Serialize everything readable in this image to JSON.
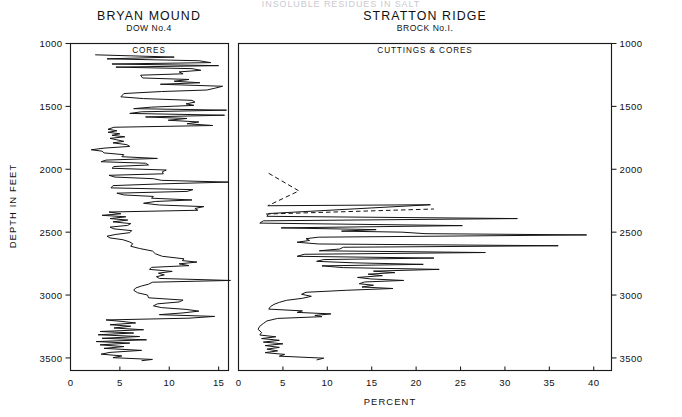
{
  "figure": {
    "top_title": "INSOLUBLE RESIDUES IN SALT",
    "x_axis_label": "PERCENT",
    "y_axis_label": "DEPTH IN FEET",
    "y_ticks": [
      "1000",
      "1500",
      "2000",
      "2500",
      "3000",
      "3500"
    ],
    "y_tick_values": [
      1000,
      1500,
      2000,
      2500,
      3000,
      3500
    ]
  },
  "panels": {
    "left": {
      "title": "BRYAN MOUND",
      "subtitle": "DOW No.4",
      "material": "CORES",
      "x_ticks": [
        "0",
        "5",
        "10",
        "15"
      ],
      "x_tick_values": [
        0,
        5,
        10,
        15
      ]
    },
    "right": {
      "title": "STRATTON RIDGE",
      "subtitle": "BROCK No.I.",
      "material": "CUTTINGS & CORES",
      "x_ticks": [
        "0",
        "5",
        "10",
        "15",
        "20",
        "25",
        "30",
        "35",
        "40"
      ],
      "x_tick_values": [
        0,
        5,
        10,
        15,
        20,
        25,
        30,
        35,
        40
      ]
    }
  },
  "colors": {
    "ink": "#141414",
    "background": "#ffffff",
    "faint_title": "#c9c9cf"
  },
  "chart_data": {
    "type": "line",
    "title": "INSOLUBLE RESIDUES IN SALT",
    "xlabel": "PERCENT",
    "ylabel": "DEPTH IN FEET",
    "orientation": "vertical-depth",
    "y_inverted": true,
    "ylim": [
      1000,
      3600
    ],
    "grid": false,
    "legend": "none",
    "series": [
      {
        "name": "BRYAN MOUND DOW No.4 — CORES",
        "panel": "left",
        "xlim": [
          0,
          16
        ],
        "style": "solid",
        "points": [
          [
            2.5,
            1090
          ],
          [
            10.5,
            1108
          ],
          [
            3.7,
            1122
          ],
          [
            13.0,
            1137
          ],
          [
            14.2,
            1152
          ],
          [
            4.2,
            1163
          ],
          [
            15.0,
            1176
          ],
          [
            4.6,
            1188
          ],
          [
            12.3,
            1200
          ],
          [
            13.2,
            1213
          ],
          [
            11.0,
            1226
          ],
          [
            11.4,
            1241
          ],
          [
            7.1,
            1252
          ],
          [
            7.3,
            1274
          ],
          [
            12.0,
            1286
          ],
          [
            10.5,
            1300
          ],
          [
            13.1,
            1312
          ],
          [
            9.1,
            1324
          ],
          [
            15.4,
            1340
          ],
          [
            14.6,
            1356
          ],
          [
            13.8,
            1370
          ],
          [
            9.2,
            1382
          ],
          [
            5.4,
            1398
          ],
          [
            5.1,
            1424
          ],
          [
            7.4,
            1438
          ],
          [
            12.3,
            1452
          ],
          [
            12.6,
            1466
          ],
          [
            11.7,
            1480
          ],
          [
            12.5,
            1492
          ],
          [
            8.2,
            1506
          ],
          [
            6.4,
            1518
          ],
          [
            15.8,
            1530
          ],
          [
            7.2,
            1543
          ],
          [
            6.0,
            1556
          ],
          [
            15.6,
            1570
          ],
          [
            7.6,
            1584
          ],
          [
            11.8,
            1596
          ],
          [
            9.9,
            1610
          ],
          [
            13.0,
            1624
          ],
          [
            11.8,
            1638
          ],
          [
            14.4,
            1652
          ],
          [
            4.4,
            1666
          ],
          [
            3.8,
            1682
          ],
          [
            4.7,
            1694
          ],
          [
            3.8,
            1706
          ],
          [
            5.0,
            1718
          ],
          [
            4.2,
            1730
          ],
          [
            5.5,
            1742
          ],
          [
            4.0,
            1754
          ],
          [
            4.7,
            1766
          ],
          [
            5.4,
            1778
          ],
          [
            4.3,
            1790
          ],
          [
            5.7,
            1804
          ],
          [
            6.0,
            1818
          ],
          [
            3.4,
            1832
          ],
          [
            2.1,
            1845
          ],
          [
            3.2,
            1856
          ],
          [
            3.4,
            1870
          ],
          [
            5.4,
            1884
          ],
          [
            5.2,
            1900
          ],
          [
            8.8,
            1914
          ],
          [
            3.6,
            1927
          ],
          [
            3.1,
            1940
          ],
          [
            7.6,
            1952
          ],
          [
            7.9,
            1966
          ],
          [
            4.4,
            1978
          ],
          [
            4.2,
            1992
          ],
          [
            9.7,
            2006
          ],
          [
            9.3,
            2020
          ],
          [
            9.4,
            2036
          ],
          [
            3.9,
            2048
          ],
          [
            4.5,
            2062
          ],
          [
            8.4,
            2075
          ],
          [
            9.2,
            2088
          ],
          [
            16.0,
            2102
          ],
          [
            9.2,
            2116
          ],
          [
            4.3,
            2130
          ],
          [
            4.1,
            2148
          ],
          [
            12.4,
            2162
          ],
          [
            11.8,
            2176
          ],
          [
            4.7,
            2190
          ],
          [
            5.4,
            2204
          ],
          [
            8.4,
            2216
          ],
          [
            8.2,
            2230
          ],
          [
            12.3,
            2244
          ],
          [
            8.6,
            2256
          ],
          [
            7.4,
            2270
          ],
          [
            9.0,
            2284
          ],
          [
            13.5,
            2297
          ],
          [
            12.6,
            2312
          ],
          [
            12.9,
            2326
          ],
          [
            3.9,
            2340
          ],
          [
            5.1,
            2354
          ],
          [
            3.2,
            2366
          ],
          [
            5.6,
            2378
          ],
          [
            4.0,
            2392
          ],
          [
            5.8,
            2404
          ],
          [
            4.3,
            2418
          ],
          [
            6.1,
            2432
          ],
          [
            5.8,
            2446
          ],
          [
            4.0,
            2460
          ],
          [
            4.4,
            2474
          ],
          [
            6.2,
            2488
          ],
          [
            6.0,
            2504
          ],
          [
            4.6,
            2518
          ],
          [
            3.7,
            2532
          ],
          [
            4.0,
            2546
          ],
          [
            5.3,
            2560
          ],
          [
            6.0,
            2578
          ],
          [
            6.3,
            2592
          ],
          [
            6.1,
            2612
          ],
          [
            7.0,
            2630
          ],
          [
            8.3,
            2650
          ],
          [
            8.6,
            2672
          ],
          [
            9.3,
            2692
          ],
          [
            11.5,
            2712
          ],
          [
            11.3,
            2726
          ],
          [
            12.8,
            2738
          ],
          [
            11.0,
            2752
          ],
          [
            12.0,
            2766
          ],
          [
            8.2,
            2780
          ],
          [
            8.0,
            2796
          ],
          [
            10.3,
            2812
          ],
          [
            8.9,
            2826
          ],
          [
            9.5,
            2840
          ],
          [
            8.7,
            2854
          ],
          [
            9.0,
            2868
          ],
          [
            16.2,
            2884
          ],
          [
            8.3,
            2898
          ],
          [
            7.9,
            2914
          ],
          [
            7.2,
            2928
          ],
          [
            6.6,
            2944
          ],
          [
            6.4,
            2962
          ],
          [
            6.8,
            2982
          ],
          [
            7.8,
            3000
          ],
          [
            7.9,
            3022
          ],
          [
            11.4,
            3040
          ],
          [
            11.0,
            3055
          ],
          [
            8.8,
            3070
          ],
          [
            8.4,
            3086
          ],
          [
            9.2,
            3100
          ],
          [
            11.7,
            3114
          ],
          [
            13.0,
            3128
          ],
          [
            11.4,
            3142
          ],
          [
            9.0,
            3156
          ],
          [
            14.6,
            3170
          ],
          [
            12.0,
            3184
          ],
          [
            3.6,
            3198
          ],
          [
            5.2,
            3210
          ],
          [
            6.6,
            3222
          ],
          [
            4.0,
            3236
          ],
          [
            6.1,
            3248
          ],
          [
            4.4,
            3262
          ],
          [
            7.4,
            3276
          ],
          [
            3.0,
            3290
          ],
          [
            6.4,
            3302
          ],
          [
            2.8,
            3316
          ],
          [
            7.0,
            3330
          ],
          [
            3.2,
            3344
          ],
          [
            7.7,
            3356
          ],
          [
            2.6,
            3370
          ],
          [
            6.0,
            3382
          ],
          [
            3.0,
            3396
          ],
          [
            5.4,
            3410
          ],
          [
            3.4,
            3424
          ],
          [
            7.2,
            3440
          ],
          [
            4.0,
            3456
          ],
          [
            3.1,
            3470
          ],
          [
            5.2,
            3484
          ],
          [
            4.3,
            3498
          ],
          [
            8.3,
            3512
          ],
          [
            7.2,
            3522
          ]
        ]
      },
      {
        "name": "STRATTON RIDGE BROCK No.I. — dashed upper",
        "panel": "right",
        "xlim": [
          0,
          42
        ],
        "style": "dashed",
        "points": [
          [
            3.4,
            2032
          ],
          [
            6.8,
            2172
          ],
          [
            3.3,
            2290
          ]
        ]
      },
      {
        "name": "STRATTON RIDGE BROCK No.I. — dashed tie",
        "panel": "right",
        "xlim": [
          0,
          42
        ],
        "style": "dashed",
        "points": [
          [
            3.1,
            2356
          ],
          [
            22.0,
            2316
          ]
        ]
      },
      {
        "name": "STRATTON RIDGE BROCK No.I. — CUTTINGS & CORES",
        "panel": "right",
        "xlim": [
          0,
          42
        ],
        "style": "solid",
        "points": [
          [
            3.3,
            2290
          ],
          [
            21.6,
            2282
          ],
          [
            3.4,
            2352
          ],
          [
            3.2,
            2374
          ],
          [
            31.4,
            2392
          ],
          [
            2.8,
            2410
          ],
          [
            2.4,
            2428
          ],
          [
            25.2,
            2448
          ],
          [
            4.8,
            2466
          ],
          [
            15.5,
            2480
          ],
          [
            11.6,
            2492
          ],
          [
            18.4,
            2500
          ],
          [
            21.0,
            2512
          ],
          [
            39.2,
            2522
          ],
          [
            9.0,
            2540
          ],
          [
            7.6,
            2552
          ],
          [
            8.0,
            2566
          ],
          [
            6.6,
            2580
          ],
          [
            9.0,
            2594
          ],
          [
            36.0,
            2608
          ],
          [
            11.8,
            2620
          ],
          [
            11.4,
            2634
          ],
          [
            9.1,
            2648
          ],
          [
            27.8,
            2662
          ],
          [
            7.4,
            2676
          ],
          [
            6.6,
            2692
          ],
          [
            22.0,
            2706
          ],
          [
            9.6,
            2718
          ],
          [
            8.8,
            2732
          ],
          [
            13.0,
            2744
          ],
          [
            20.8,
            2756
          ],
          [
            9.4,
            2768
          ],
          [
            11.8,
            2782
          ],
          [
            22.6,
            2796
          ],
          [
            15.2,
            2810
          ],
          [
            17.6,
            2822
          ],
          [
            14.6,
            2834
          ],
          [
            16.2,
            2846
          ],
          [
            13.4,
            2860
          ],
          [
            14.9,
            2872
          ],
          [
            18.6,
            2884
          ],
          [
            14.2,
            2896
          ],
          [
            13.6,
            2910
          ],
          [
            15.2,
            2922
          ],
          [
            13.9,
            2936
          ],
          [
            17.4,
            2948
          ],
          [
            12.2,
            2962
          ],
          [
            7.6,
            2978
          ],
          [
            7.1,
            2994
          ],
          [
            8.2,
            3010
          ],
          [
            7.2,
            3026
          ],
          [
            5.4,
            3042
          ],
          [
            4.6,
            3058
          ],
          [
            4.0,
            3074
          ],
          [
            3.6,
            3092
          ],
          [
            3.4,
            3112
          ],
          [
            7.2,
            3126
          ],
          [
            6.6,
            3138
          ],
          [
            10.4,
            3150
          ],
          [
            8.6,
            3162
          ],
          [
            9.4,
            3172
          ],
          [
            4.4,
            3186
          ],
          [
            3.2,
            3206
          ],
          [
            2.8,
            3226
          ],
          [
            2.4,
            3248
          ],
          [
            2.2,
            3272
          ],
          [
            2.6,
            3298
          ],
          [
            2.4,
            3318
          ],
          [
            4.2,
            3332
          ],
          [
            2.6,
            3346
          ],
          [
            4.6,
            3360
          ],
          [
            2.8,
            3374
          ],
          [
            5.0,
            3388
          ],
          [
            3.0,
            3402
          ],
          [
            4.6,
            3416
          ],
          [
            3.2,
            3430
          ],
          [
            4.4,
            3444
          ],
          [
            3.0,
            3458
          ],
          [
            5.2,
            3472
          ],
          [
            4.6,
            3486
          ],
          [
            9.6,
            3502
          ],
          [
            8.8,
            3516
          ]
        ]
      }
    ]
  }
}
